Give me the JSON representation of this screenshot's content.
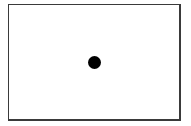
{
  "diagram": {
    "frame": {
      "shape": "rectangle",
      "stroke_color": "#3a3a3a",
      "fill_color": "#ffffff"
    },
    "dot": {
      "shape": "filled-circle",
      "color": "#000000",
      "position": "center",
      "center_x": 94,
      "center_y": 62,
      "radius": 6.5
    }
  }
}
